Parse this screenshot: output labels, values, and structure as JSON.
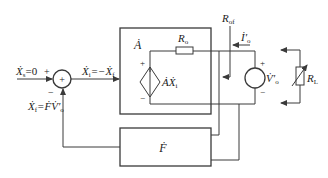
{
  "diagram": {
    "type": "feedback-amplifier-block-diagram",
    "colors": {
      "line": "#3a3a3a",
      "background": "#ffffff"
    },
    "input": {
      "label": "Ẋ",
      "sub": "s",
      "eq": "=0"
    },
    "summer": {
      "plus": "+",
      "minus": "−",
      "center_symbol": "+"
    },
    "error_signal": {
      "label": "Ẋ",
      "sub": "i",
      "eq": "=−Ẋ",
      "eq_sub": "f"
    },
    "feedback_signal": {
      "label": "Ẋ",
      "sub": "f",
      "eq": "=ḞV̇′",
      "eq_sub": "o"
    },
    "amplifier": {
      "label": "Ȧ",
      "output_resistance": {
        "label": "R",
        "sub": "o"
      },
      "dependent_source": {
        "label": "ȦẊ",
        "sub": "i",
        "plus": "+",
        "minus": "−"
      }
    },
    "output_resistance_feedback": {
      "label": "R",
      "sub": "of"
    },
    "output_current": {
      "label": "İ′",
      "sub": "o"
    },
    "test_source": {
      "label": "V̇′",
      "sub": "o",
      "plus": "+",
      "minus": "−"
    },
    "load": {
      "label": "R",
      "sub": "L"
    },
    "feedback_network": {
      "label": "Ḟ"
    }
  }
}
